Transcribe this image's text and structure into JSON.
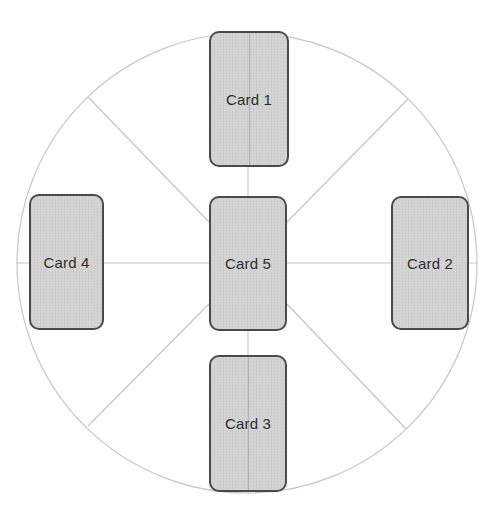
{
  "diagram": {
    "type": "card-spread",
    "circle": {
      "cx": 247,
      "cy": 263,
      "r": 230,
      "stroke": "#c6c6c6"
    },
    "spokes": [
      {
        "name": "spoke-top",
        "x1": 248,
        "y1": 33,
        "x2": 248,
        "y2": 196
      },
      {
        "name": "spoke-bottom",
        "x1": 248,
        "y1": 331,
        "x2": 248,
        "y2": 493
      },
      {
        "name": "spoke-left",
        "x1": 17,
        "y1": 263,
        "x2": 209,
        "y2": 263
      },
      {
        "name": "spoke-right",
        "x1": 287,
        "y1": 263,
        "x2": 477,
        "y2": 263
      },
      {
        "name": "spoke-upper-left",
        "x1": 88,
        "y1": 97,
        "x2": 209,
        "y2": 222
      },
      {
        "name": "spoke-upper-right",
        "x1": 408,
        "y1": 99,
        "x2": 287,
        "y2": 222
      },
      {
        "name": "spoke-lower-left",
        "x1": 88,
        "y1": 426,
        "x2": 209,
        "y2": 304
      },
      {
        "name": "spoke-lower-right",
        "x1": 406,
        "y1": 429,
        "x2": 287,
        "y2": 304
      }
    ],
    "line_color": "#c6c6c6",
    "card_fill": "#d3d3d3",
    "card_border": "#4a4a4a",
    "cards": [
      {
        "id": "card-1",
        "label": "Card 1",
        "x": 209,
        "y": 31,
        "w": 80,
        "h": 136,
        "center_line": true
      },
      {
        "id": "card-2",
        "label": "Card 2",
        "x": 391,
        "y": 196,
        "w": 78,
        "h": 134,
        "center_line": false
      },
      {
        "id": "card-3",
        "label": "Card 3",
        "x": 209,
        "y": 355,
        "w": 78,
        "h": 137,
        "center_line": true
      },
      {
        "id": "card-4",
        "label": "Card 4",
        "x": 29,
        "y": 194,
        "w": 75,
        "h": 136,
        "center_line": false
      },
      {
        "id": "card-5",
        "label": "Card 5",
        "x": 209,
        "y": 196,
        "w": 78,
        "h": 135,
        "center_line": false
      }
    ]
  }
}
